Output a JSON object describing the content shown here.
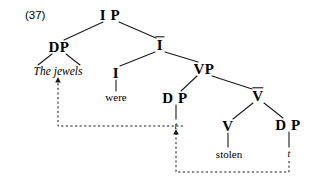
{
  "figure": {
    "example_number": "(37)",
    "type": "syntax-tree",
    "background_color": "#ffffff",
    "line_color": "#1a1a1a",
    "text_color": "#000000"
  },
  "nodes": [
    {
      "id": "IP",
      "label": "I P",
      "x": 110,
      "y": 15,
      "kind": "phrase"
    },
    {
      "id": "DP1",
      "label": "DP",
      "x": 59,
      "y": 47,
      "kind": "phrase"
    },
    {
      "id": "Ibar",
      "label": "I",
      "x": 160,
      "y": 45,
      "kind": "bar"
    },
    {
      "id": "I",
      "label": "I",
      "x": 116,
      "y": 73,
      "kind": "head"
    },
    {
      "id": "VP",
      "label": "VP",
      "x": 204,
      "y": 69,
      "kind": "phrase"
    },
    {
      "id": "DP2",
      "label": "D P",
      "x": 175,
      "y": 98,
      "kind": "phrase"
    },
    {
      "id": "Vbar",
      "label": "V",
      "x": 258,
      "y": 96,
      "kind": "bar"
    },
    {
      "id": "V",
      "label": "V",
      "x": 228,
      "y": 126,
      "kind": "head"
    },
    {
      "id": "DP3",
      "label": "D P",
      "x": 288,
      "y": 125,
      "kind": "phrase"
    }
  ],
  "terminals": [
    {
      "id": "jewels",
      "label": "The jewels",
      "x": 58,
      "y": 72,
      "style": "italic"
    },
    {
      "id": "were",
      "label": "were",
      "x": 116,
      "y": 97,
      "style": "roman"
    },
    {
      "id": "stolen",
      "label": "stolen",
      "x": 229,
      "y": 154,
      "style": "roman"
    }
  ],
  "traces": [
    {
      "id": "t1",
      "label": "t",
      "x": 176,
      "y": 126
    },
    {
      "id": "t2",
      "label": "t",
      "x": 289,
      "y": 154
    }
  ],
  "branches": [
    {
      "from": "IP",
      "to": "DP1",
      "x1": 103,
      "y1": 22,
      "x2": 64,
      "y2": 40
    },
    {
      "from": "IP",
      "to": "Ibar",
      "x1": 119,
      "y1": 22,
      "x2": 156,
      "y2": 38
    },
    {
      "from": "DP1",
      "to": "left-spec",
      "x1": 52,
      "y1": 54,
      "x2": 38,
      "y2": 65
    },
    {
      "from": "DP1",
      "to": "right-spec",
      "x1": 66,
      "y1": 54,
      "x2": 80,
      "y2": 65
    },
    {
      "from": "Ibar",
      "to": "I",
      "x1": 155,
      "y1": 52,
      "x2": 120,
      "y2": 66
    },
    {
      "from": "Ibar",
      "to": "VP",
      "x1": 165,
      "y1": 52,
      "x2": 198,
      "y2": 62
    },
    {
      "from": "I",
      "to": "were",
      "x1": 116,
      "y1": 80,
      "x2": 116,
      "y2": 91
    },
    {
      "from": "VP",
      "to": "DP2",
      "x1": 197,
      "y1": 76,
      "x2": 181,
      "y2": 91
    },
    {
      "from": "VP",
      "to": "Vbar",
      "x1": 212,
      "y1": 76,
      "x2": 252,
      "y2": 89
    },
    {
      "from": "DP2",
      "to": "t1",
      "x1": 176,
      "y1": 105,
      "x2": 176,
      "y2": 119
    },
    {
      "from": "Vbar",
      "to": "V",
      "x1": 253,
      "y1": 103,
      "x2": 233,
      "y2": 119
    },
    {
      "from": "Vbar",
      "to": "DP3",
      "x1": 264,
      "y1": 103,
      "x2": 283,
      "y2": 118
    },
    {
      "from": "V",
      "to": "stolen",
      "x1": 228,
      "y1": 133,
      "x2": 228,
      "y2": 147
    },
    {
      "from": "DP3",
      "to": "t2",
      "x1": 289,
      "y1": 132,
      "x2": 289,
      "y2": 147
    }
  ],
  "movement_arrows": [
    {
      "id": "a-movement",
      "from_trace": "t1",
      "to_node": "jewels",
      "path": "M 183 126 L 58 126 L 58 82",
      "arrow_at": {
        "x": 58,
        "y": 79,
        "direction": "up"
      }
    },
    {
      "id": "object-movement",
      "from_trace": "t2",
      "to_node": "t1",
      "path": "M 289 161 L 289 172 L 176 172 L 176 134",
      "arrow_at": {
        "x": 176,
        "y": 131,
        "direction": "up"
      }
    }
  ],
  "sentence": "The jewels were stolen"
}
